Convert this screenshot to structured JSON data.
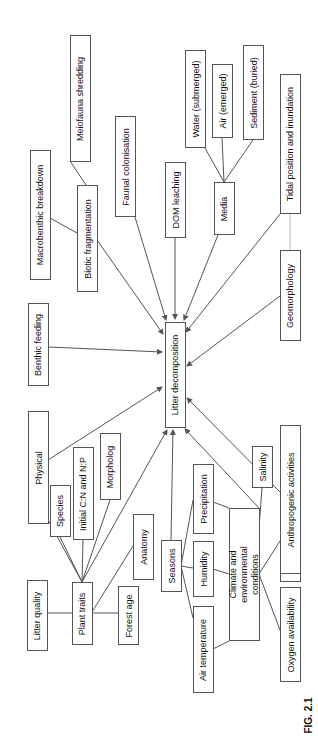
{
  "figure": {
    "label": "FIG. 2.1",
    "orientation": "rotated-90-ccw",
    "line_color": "#555555",
    "light_line_color": "#bbbbbb",
    "center_node": "Litter decomposition"
  },
  "nodes": {
    "center": "Litter decomposition",
    "meiofauna": "Meiofauna shredding",
    "macrobenthic": "Macrobenthic breakdown",
    "biotic": "Biotic fragmentation",
    "faunal": "Faunal colonisation",
    "dom": "DOM leaching",
    "water": "Water (submerged)",
    "air": "Air (emerged)",
    "sediment": "Sediment  (buried)",
    "media": "Media",
    "tidal": "Tidal position and inundation",
    "geomorph": "Geomorphology",
    "benthic": "Benthic feeding",
    "physical": "Physical",
    "species": "Species",
    "cn": "Initial C:N and N:P",
    "morph": "Morpholog",
    "anatomy": "Anatomy",
    "litterq": "Litter quality",
    "plant": "Plant traits",
    "forest": "Forest age",
    "seasons": "Seasons",
    "airtemp": "Air temperature",
    "humidity": "Humidity",
    "precip": "Precipitation",
    "climate": "Climate and environmental conditions",
    "salinity": "Salinity",
    "oxygen": "Oxygen availability",
    "redox": "Redox potential",
    "anthro": "Anthropogenic activities"
  },
  "edges": [
    {
      "from": "Meiofauna shredding",
      "to": "Biotic fragmentation"
    },
    {
      "from": "Macrobenthic breakdown",
      "to": "Biotic fragmentation"
    },
    {
      "from": "Biotic fragmentation",
      "to": "Litter decomposition",
      "arrow": true
    },
    {
      "from": "Faunal colonisation",
      "to": "Litter decomposition",
      "arrow": true
    },
    {
      "from": "DOM leaching",
      "to": "Litter decomposition",
      "arrow": true
    },
    {
      "from": "Water (submerged)",
      "to": "Media"
    },
    {
      "from": "Air (emerged)",
      "to": "Media"
    },
    {
      "from": "Sediment  (buried)",
      "to": "Media"
    },
    {
      "from": "Media",
      "to": "Litter decomposition",
      "arrow": true
    },
    {
      "from": "Tidal position and inundation",
      "to": "Litter decomposition",
      "arrow": true
    },
    {
      "from": "Tidal position and inundation",
      "to": "Geomorphology"
    },
    {
      "from": "Geomorphology",
      "to": "Litter decomposition",
      "arrow": true
    },
    {
      "from": "Benthic feeding",
      "to": "Litter decomposition",
      "arrow": true
    },
    {
      "from": "Physical",
      "to": "Litter decomposition",
      "arrow": true
    },
    {
      "from": "Physical",
      "to": "Plant traits"
    },
    {
      "from": "Species",
      "to": "Plant traits"
    },
    {
      "from": "Initial C:N and N:P",
      "to": "Plant traits"
    },
    {
      "from": "Morpholog",
      "to": "Plant traits"
    },
    {
      "from": "Anatomy",
      "to": "Plant traits"
    },
    {
      "from": "Litter quality",
      "to": "Plant traits"
    },
    {
      "from": "Forest age",
      "to": "Plant traits"
    },
    {
      "from": "Plant traits",
      "to": "Litter decomposition",
      "arrow": true
    },
    {
      "from": "Seasons",
      "to": "Litter decomposition",
      "arrow": true
    },
    {
      "from": "Seasons",
      "to": "Air temperature"
    },
    {
      "from": "Seasons",
      "to": "Humidity"
    },
    {
      "from": "Seasons",
      "to": "Precipitation"
    },
    {
      "from": "Air temperature",
      "to": "Climate and environmental conditions"
    },
    {
      "from": "Humidity",
      "to": "Climate and environmental conditions"
    },
    {
      "from": "Precipitation",
      "to": "Climate and environmental conditions"
    },
    {
      "from": "Climate and environmental conditions",
      "to": "Litter decomposition",
      "arrow": true
    },
    {
      "from": "Salinity",
      "to": "Climate and environmental conditions"
    },
    {
      "from": "Oxygen availability",
      "to": "Climate and environmental conditions"
    },
    {
      "from": "Redox potential",
      "to": "Climate and environmental conditions"
    },
    {
      "from": "Anthropogenic activities",
      "to": "Litter decomposition",
      "arrow": true
    }
  ]
}
